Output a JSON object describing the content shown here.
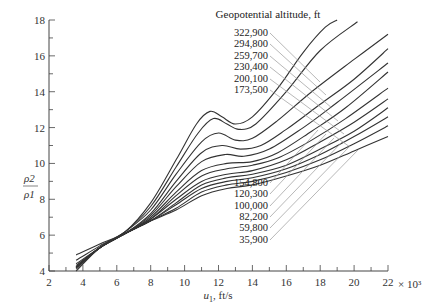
{
  "chart_data": {
    "type": "line",
    "title": "",
    "legend_title": "Geopotential altitude, ft",
    "xlabel": "u1, ft/s",
    "xlabel_main": "u",
    "xlabel_sub": "1",
    "xlabel_unit": ", ft/s",
    "x_multiplier": "× 10³",
    "ylabel_num": "ρ2",
    "ylabel_den": "ρ1",
    "xlim": [
      2,
      22
    ],
    "ylim": [
      4,
      18
    ],
    "x_ticks": [
      2,
      4,
      6,
      8,
      10,
      12,
      14,
      16,
      18,
      20,
      22
    ],
    "y_ticks": [
      4,
      6,
      8,
      10,
      12,
      14,
      16,
      18
    ],
    "grid": false,
    "series": [
      {
        "name": "322,900",
        "x": [
          3.6,
          5,
          6.5,
          8,
          9.5,
          10.7,
          11.5,
          12.2,
          13,
          14,
          15.5,
          17,
          18.3,
          19
        ],
        "y": [
          4.9,
          5.5,
          6.2,
          7.8,
          10.2,
          12.2,
          12.9,
          12.6,
          12.2,
          12.6,
          14.2,
          16.2,
          17.6,
          18
        ]
      },
      {
        "name": "294,800",
        "x": [
          3.6,
          5,
          6.5,
          8,
          9.5,
          10.8,
          11.7,
          12.5,
          13.2,
          14.2,
          16,
          18,
          20.2
        ],
        "y": [
          4.6,
          5.4,
          6.2,
          7.6,
          9.8,
          11.7,
          12.5,
          12.2,
          11.9,
          12.2,
          14,
          16.3,
          17.9
        ]
      },
      {
        "name": "259,700",
        "x": [
          3.6,
          5,
          6.5,
          8,
          9.5,
          11,
          12,
          13,
          14,
          15.5,
          17.5,
          20,
          22
        ],
        "y": [
          4.4,
          5.3,
          6.2,
          7.4,
          9.4,
          11.2,
          11.7,
          11.3,
          11.4,
          12.4,
          14,
          15.8,
          17.2
        ]
      },
      {
        "name": "230,400",
        "x": [
          3.6,
          5,
          6.5,
          8,
          9.5,
          11,
          12.2,
          13.3,
          14.5,
          16,
          18,
          20,
          22
        ],
        "y": [
          4.3,
          5.3,
          6.1,
          7.2,
          9.0,
          10.6,
          11.0,
          10.8,
          11.0,
          11.9,
          13.3,
          14.7,
          16.4
        ]
      },
      {
        "name": "200,100",
        "x": [
          3.6,
          5,
          6.5,
          8,
          9.5,
          11,
          12.4,
          13.5,
          15,
          17,
          19,
          22
        ],
        "y": [
          4.2,
          5.3,
          6.1,
          7.1,
          8.7,
          10.1,
          10.5,
          10.4,
          10.8,
          12.0,
          13.4,
          15.6
        ]
      },
      {
        "name": "173,500",
        "x": [
          3.6,
          5,
          6.5,
          8,
          9.5,
          11,
          12.5,
          14,
          15.5,
          17.5,
          19.5,
          22
        ],
        "y": [
          4.2,
          5.3,
          6.1,
          7.0,
          8.4,
          9.6,
          10.0,
          10.1,
          10.6,
          11.8,
          13.1,
          15.1
        ]
      },
      {
        "name": "154,800",
        "x": [
          3.6,
          5,
          6.5,
          8,
          9.5,
          11,
          12.5,
          14,
          15.5,
          17.5,
          19.5,
          22
        ],
        "y": [
          4.2,
          5.3,
          6.1,
          6.9,
          8.2,
          9.3,
          9.7,
          9.9,
          10.3,
          11.3,
          12.5,
          14.2
        ]
      },
      {
        "name": "120,300",
        "x": [
          3.6,
          5,
          6.5,
          8,
          9.5,
          11,
          12.5,
          14,
          16,
          18,
          20,
          22
        ],
        "y": [
          4.2,
          5.3,
          6.1,
          6.9,
          8.0,
          9.0,
          9.4,
          9.6,
          10.2,
          11.2,
          12.3,
          13.6
        ]
      },
      {
        "name": "100,000",
        "x": [
          3.6,
          5,
          6.5,
          8,
          9.5,
          11,
          12.5,
          14,
          16,
          18,
          20,
          22
        ],
        "y": [
          4.2,
          5.3,
          6.1,
          6.8,
          7.8,
          8.8,
          9.2,
          9.4,
          9.9,
          10.8,
          11.8,
          13.1
        ]
      },
      {
        "name": "82,200",
        "x": [
          3.6,
          5,
          6.5,
          8,
          9.5,
          11,
          12.5,
          14,
          16,
          18,
          20,
          22
        ],
        "y": [
          4.2,
          5.3,
          6.1,
          6.8,
          7.7,
          8.6,
          9.0,
          9.2,
          9.7,
          10.5,
          11.5,
          12.6
        ]
      },
      {
        "name": "59,800",
        "x": [
          3.6,
          5,
          6.5,
          8,
          9.5,
          11,
          12.5,
          14,
          16,
          18,
          20,
          22
        ],
        "y": [
          4.1,
          5.3,
          6.1,
          6.8,
          7.5,
          8.4,
          8.8,
          9.0,
          9.5,
          10.2,
          11.1,
          12.1
        ]
      },
      {
        "name": "35,900",
        "x": [
          3.6,
          5,
          6.5,
          8,
          9.5,
          11,
          12.5,
          14,
          16,
          18,
          20,
          22
        ],
        "y": [
          4.0,
          5.3,
          6.1,
          6.8,
          7.4,
          8.2,
          8.6,
          8.8,
          9.3,
          9.9,
          10.7,
          11.5
        ]
      }
    ],
    "legend_top": [
      "322,900",
      "294,800",
      "259,700",
      "230,400",
      "200,100",
      "173,500"
    ],
    "legend_bottom": [
      "154,800",
      "120,300",
      "100,000",
      "82,200",
      "59,800",
      "35,900"
    ]
  }
}
